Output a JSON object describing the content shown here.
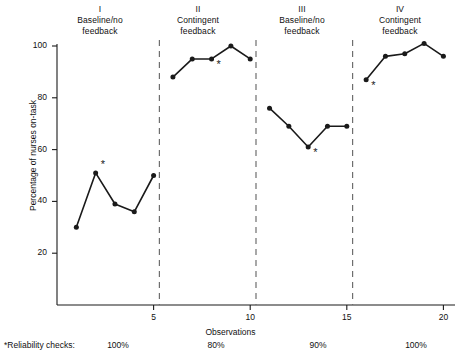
{
  "chart_data": {
    "type": "line",
    "title": "",
    "xlabel": "Observations",
    "ylabel": "Percentage of nurses on-task",
    "xlim": [
      0,
      20.6
    ],
    "ylim": [
      0,
      105
    ],
    "grid": false,
    "legend": "none",
    "x_ticks": [
      5,
      10,
      15,
      20
    ],
    "y_ticks": [
      20,
      40,
      60,
      80,
      100
    ],
    "phase_dividers": [
      5.3,
      10.3,
      15.3
    ],
    "series": [
      {
        "name": "I Baseline/no feedback",
        "x": [
          1,
          2,
          3,
          4,
          5
        ],
        "values": [
          30,
          51,
          39,
          36,
          50
        ]
      },
      {
        "name": "II Contingent feedback",
        "x": [
          6,
          7,
          8,
          9,
          10
        ],
        "values": [
          88,
          95,
          95,
          100,
          95
        ]
      },
      {
        "name": "III Baseline/no feedback",
        "x": [
          11,
          12,
          13,
          14,
          15
        ],
        "values": [
          76,
          69,
          61,
          69,
          69
        ]
      },
      {
        "name": "IV Contingent feedback",
        "x": [
          16,
          17,
          18,
          19,
          20
        ],
        "values": [
          87,
          96,
          97,
          101,
          96
        ]
      }
    ],
    "annotations": [
      {
        "marker": "*",
        "x": 2,
        "y": 51,
        "position": "upper-right"
      },
      {
        "marker": "*",
        "x": 8,
        "y": 95,
        "position": "lower-right"
      },
      {
        "marker": "*",
        "x": 13,
        "y": 61,
        "position": "lower-right"
      },
      {
        "marker": "*",
        "x": 16,
        "y": 87,
        "position": "lower-right"
      }
    ]
  },
  "phases": [
    {
      "roman": "I",
      "name": "Baseline/no\nfeedback",
      "center_x": 100
    },
    {
      "roman": "II",
      "name": "Contingent\nfeedback",
      "center_x": 198
    },
    {
      "roman": "III",
      "name": "Baseline/no\nfeedback",
      "center_x": 302
    },
    {
      "roman": "IV",
      "name": "Contingent\nfeedback",
      "center_x": 400
    }
  ],
  "footnote": {
    "label": "*Reliability checks:",
    "values": [
      "100%",
      "80%",
      "90%",
      "100%"
    ]
  }
}
